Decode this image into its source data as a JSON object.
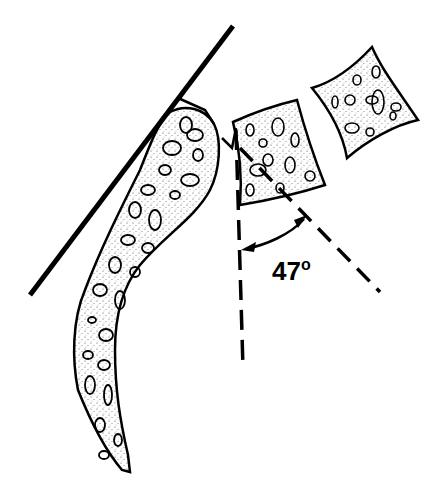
{
  "diagram": {
    "type": "anatomical-angle-measurement",
    "angle": {
      "value": "47",
      "unit": "o",
      "label": "47°"
    },
    "elements": [
      {
        "id": "tangent-line",
        "description": "solid straight line tangent to curved structure"
      },
      {
        "id": "curved-structure",
        "description": "long curved stippled bone-like shape"
      },
      {
        "id": "block-1",
        "description": "stippled quadrilateral block adjacent to curve"
      },
      {
        "id": "block-2",
        "description": "stippled quadrilateral block, upper right"
      },
      {
        "id": "vertical-reference-line",
        "description": "dashed vertical line"
      },
      {
        "id": "oblique-reference-line",
        "description": "dashed oblique line through block-1"
      },
      {
        "id": "angle-arc",
        "description": "double-headed arc arrow between dashed lines"
      }
    ],
    "colors": {
      "stroke": "#000000",
      "background": "#ffffff",
      "stipple": "#555555"
    }
  }
}
